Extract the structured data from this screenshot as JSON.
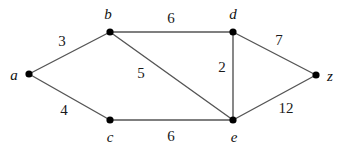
{
  "figure": {
    "type": "weighted-undirected-graph",
    "background_color": "#ffffff",
    "edge_color": "#555555",
    "vertex_color": "#000000",
    "label_color": "#111111",
    "width": 343,
    "height": 148
  },
  "graph": {
    "vertices": [
      {
        "id": "a",
        "label": "a",
        "x": 29,
        "y": 74,
        "label_x": 14,
        "label_y": 75
      },
      {
        "id": "b",
        "label": "b",
        "x": 110,
        "y": 32,
        "label_x": 108,
        "label_y": 14
      },
      {
        "id": "c",
        "label": "c",
        "x": 110,
        "y": 120,
        "label_x": 110,
        "label_y": 137
      },
      {
        "id": "d",
        "label": "d",
        "x": 233,
        "y": 32,
        "label_x": 233,
        "label_y": 14
      },
      {
        "id": "e",
        "label": "e",
        "x": 233,
        "y": 120,
        "label_x": 234,
        "label_y": 137
      },
      {
        "id": "z",
        "label": "z",
        "x": 316,
        "y": 75,
        "label_x": 330,
        "label_y": 76
      }
    ],
    "edges": [
      {
        "from": "a",
        "to": "b",
        "weight": "3",
        "label_x": 62,
        "label_y": 41
      },
      {
        "from": "a",
        "to": "c",
        "weight": "4",
        "label_x": 64,
        "label_y": 110
      },
      {
        "from": "b",
        "to": "d",
        "weight": "6",
        "label_x": 171,
        "label_y": 18
      },
      {
        "from": "b",
        "to": "e",
        "weight": "5",
        "label_x": 141,
        "label_y": 73
      },
      {
        "from": "c",
        "to": "e",
        "weight": "6",
        "label_x": 171,
        "label_y": 136
      },
      {
        "from": "d",
        "to": "e",
        "weight": "2",
        "label_x": 222,
        "label_y": 67
      },
      {
        "from": "d",
        "to": "z",
        "weight": "7",
        "label_x": 279,
        "label_y": 40
      },
      {
        "from": "e",
        "to": "z",
        "weight": "12",
        "label_x": 286,
        "label_y": 108
      }
    ]
  }
}
